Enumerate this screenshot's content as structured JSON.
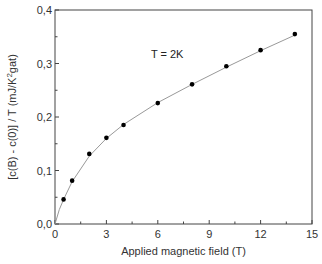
{
  "chart_data": {
    "type": "scatter",
    "title": "",
    "xlabel": "Applied magnetic field (T)",
    "ylabel": "[c(B) - c(0)] / T  (mJ/K²gat)",
    "xlim": [
      0,
      15
    ],
    "ylim": [
      0,
      0.4
    ],
    "x_ticks": [
      0,
      3,
      6,
      9,
      12,
      15
    ],
    "x_tick_labels": [
      "0",
      "3",
      "6",
      "9",
      "12",
      "15"
    ],
    "y_ticks": [
      0.0,
      0.1,
      0.2,
      0.3,
      0.4
    ],
    "y_tick_labels": [
      "0,0",
      "0,1",
      "0,2",
      "0,3",
      "0,4"
    ],
    "grid": false,
    "legend": null,
    "annotations": [
      {
        "text": "T = 2K",
        "x": 5.6,
        "y": 0.31
      }
    ],
    "series": [
      {
        "name": "data",
        "marker": "filled-circle",
        "color": "#000000",
        "x": [
          0.5,
          1,
          2,
          3,
          4,
          6,
          8,
          10,
          12,
          14
        ],
        "y": [
          0.046,
          0.081,
          0.131,
          0.161,
          0.185,
          0.226,
          0.261,
          0.295,
          0.325,
          0.355
        ]
      },
      {
        "name": "fit",
        "line": "solid",
        "color": "#999999",
        "x": [
          0,
          0.25,
          0.5,
          1,
          2,
          3,
          4,
          6,
          8,
          10,
          12,
          14
        ],
        "y": [
          0,
          0.027,
          0.046,
          0.079,
          0.127,
          0.16,
          0.186,
          0.227,
          0.261,
          0.293,
          0.324,
          0.353
        ]
      }
    ]
  }
}
